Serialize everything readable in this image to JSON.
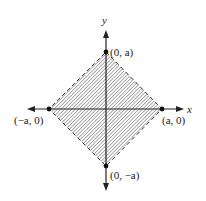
{
  "diagram": {
    "axis_labels": {
      "x": "x",
      "y": "y"
    },
    "vertices": [
      {
        "label": "(0, a)",
        "x": 0,
        "y": "a"
      },
      {
        "label": "(a, 0)",
        "x": "a",
        "y": 0
      },
      {
        "label": "(0, −a)",
        "x": 0,
        "y": "−a"
      },
      {
        "label": "(−a, 0)",
        "x": "−a",
        "y": 0
      }
    ],
    "region": {
      "shape": "square (diamond) |x|+|y|<a",
      "boundary": "dashed",
      "fill": "hatched"
    },
    "colors": {
      "ink": "#222222",
      "hatch": "#555555"
    }
  }
}
